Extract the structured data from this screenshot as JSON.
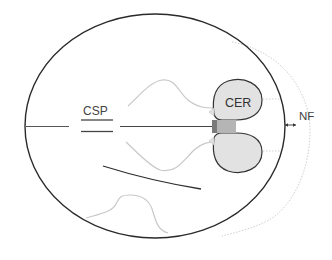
{
  "diagram": {
    "type": "fetal-head-axial-transcerebellar-plane",
    "labels": {
      "csp": "CSP",
      "cer": "CER",
      "nf": "NF"
    },
    "colors": {
      "skull_outline": "#2a2a2a",
      "soft_structures": "#c8c8c8",
      "cerebellum_fill": "#e2e2e2",
      "cerebellum_stroke": "#333333",
      "brainstem_fill": "#b5b5b5",
      "brainstem_dark": "#7a7a7a",
      "nuchal_fold_dotted": "#c9c9c9",
      "label_text": "#444444"
    }
  }
}
